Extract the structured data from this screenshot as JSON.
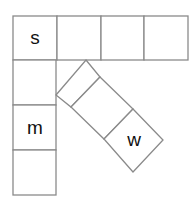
{
  "diagram": {
    "top_row": {
      "cells": [
        "s",
        "",
        "",
        ""
      ]
    },
    "left_column": {
      "cells": [
        "s",
        "",
        "m",
        ""
      ]
    },
    "diagonal_strip": {
      "cells": [
        "",
        "",
        "w"
      ]
    },
    "labels": {
      "s": "s",
      "m": "m",
      "w": "w"
    },
    "colors": {
      "stroke": "#8a8a8a",
      "text": "#111111",
      "background": "#ffffff"
    }
  }
}
